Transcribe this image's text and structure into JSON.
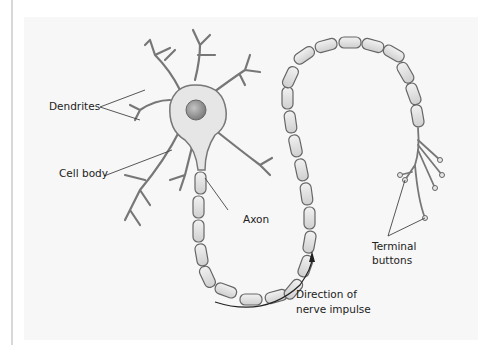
{
  "diagram": {
    "labels": {
      "dendrites": "Dendrites",
      "cell_body": "Cell body",
      "axon": "Axon",
      "terminal_buttons_line1": "Terminal",
      "terminal_buttons_line2": "buttons",
      "direction_line1": "Direction of",
      "direction_line2": "nerve impulse"
    },
    "colors": {
      "background": "#ffffff",
      "panel": "#f7f7f7",
      "cell_fill": "#e6e6e6",
      "outline": "#555555",
      "nucleus": "#9a9a9a",
      "myelin_fill": "#e2e2e2"
    }
  }
}
